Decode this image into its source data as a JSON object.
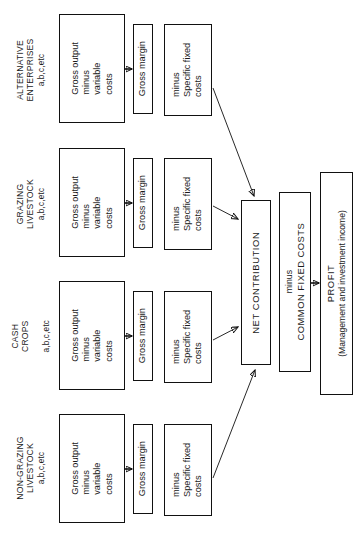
{
  "diagram": {
    "orientation": "rotated-90-ccw",
    "background": "#ffffff",
    "line_color": "#111111",
    "groups": [
      {
        "id": "alternative-enterprises",
        "name": "ALTERNATIVE ENTERPRISES",
        "sub": "a,b,c,etc",
        "gross_output": "Gross output\nminus\nvariable\ncosts",
        "gross_margin": "Gross margin",
        "specific_fixed": "minus\nSpecific fixed\ncosts"
      },
      {
        "id": "grazing-livestock",
        "name": "GRAZING LIVESTOCK",
        "sub": "a,b,c,etc",
        "gross_output": "Gross output\nminus\nvariable\ncosts",
        "gross_margin": "Gross margin",
        "specific_fixed": "minus\nSpecific fixed\ncosts"
      },
      {
        "id": "cash-crops",
        "name": "CASH CROPS",
        "sub": "a,b,c,etc",
        "gross_output": "Gross output\nminus\nvariable\ncosts",
        "gross_margin": "Gross margin",
        "specific_fixed": "minus\nSpecific fixed\ncosts"
      },
      {
        "id": "non-grazing-livestock",
        "name": "NON-GRAZING LIVESTOCK",
        "sub": "a,b,c,etc",
        "gross_output": "Gross output\nminus\nvariable\ncosts",
        "gross_margin": "Gross margin",
        "specific_fixed": "minus\nSpecific fixed\ncosts"
      }
    ],
    "net_contribution": {
      "label": "NET CONTRIBUTION"
    },
    "common_fixed_costs": {
      "minus": "minus",
      "label": "COMMON FIXED COSTS"
    },
    "profit": {
      "label": "PROFIT",
      "sub": "(Management and investment income)"
    }
  }
}
